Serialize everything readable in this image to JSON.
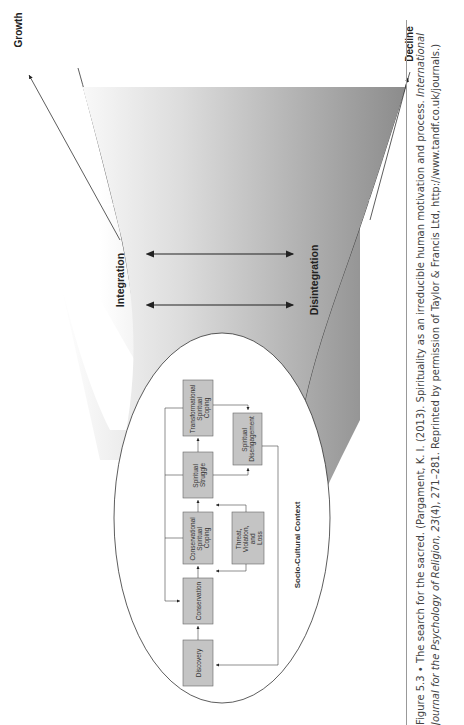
{
  "figure": {
    "axis_labels": {
      "growth": "Growth",
      "decline": "Decline"
    },
    "direction_labels": {
      "integration": "Integration",
      "disintegration": "Disintegration"
    },
    "context_label": "Socio-Cultural Context",
    "boxes": {
      "discovery": "Discovery",
      "conservation": "Conservation",
      "conservational_coping": [
        "Conservational",
        "Spiritual",
        "Coping"
      ],
      "spiritual_struggle": [
        "Spiritual",
        "Struggle"
      ],
      "transformational_coping": [
        "Transformational",
        "Spiritual",
        "Coping"
      ],
      "threat": [
        "Threat,",
        "Violation,",
        "and",
        "Loss"
      ],
      "disengagement": [
        "Spiritual",
        "Disengagement"
      ]
    },
    "colors": {
      "box_fill": "#c4c4c4",
      "funnel_dark": "#8a8a8a",
      "funnel_light": "#ffffff",
      "line": "#333333"
    }
  },
  "caption": {
    "figure_number": "Figure 5.3",
    "separator": " • ",
    "title": "The search for the sacred.",
    "citation_plain": " (Pargament, K. I. (2013). Spirituality as an irreducible human motivation and process. ",
    "journal_italic": "International Journal for the Psychology of Religion, 23",
    "issue_pages": "(4), 271–281. Reprinted by permission of Taylor & Francis Ltd, http://www.tandf.co.uk/journals.)"
  }
}
